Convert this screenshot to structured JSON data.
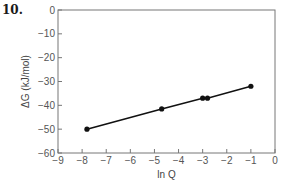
{
  "problem_number": "10.",
  "chart_data": {
    "type": "line",
    "title": "",
    "xlabel": "ln Q",
    "ylabel": "ΔG (kJ/mol)",
    "xlim": [
      -9,
      0
    ],
    "ylim": [
      -60,
      0
    ],
    "grid": false,
    "legend": null,
    "x_ticks": [
      -9,
      -8,
      -7,
      -6,
      -5,
      -4,
      -3,
      -2,
      -1,
      0
    ],
    "x_tick_labels": [
      "−9",
      "−8",
      "−7",
      "−6",
      "−5",
      "−4",
      "−3",
      "−2",
      "−1",
      "0"
    ],
    "y_ticks": [
      0,
      -10,
      -20,
      -30,
      -40,
      -50,
      -60
    ],
    "y_tick_labels": [
      "0",
      "−10",
      "−20",
      "−30",
      "−40",
      "−50",
      "−60"
    ],
    "series": [
      {
        "name": "ΔG vs ln Q",
        "x": [
          -7.8,
          -4.7,
          -3.0,
          -2.8,
          -1.0
        ],
        "y": [
          -50,
          -41.5,
          -37,
          -37,
          -32
        ],
        "marker": "circle",
        "color": "#111111"
      }
    ]
  }
}
